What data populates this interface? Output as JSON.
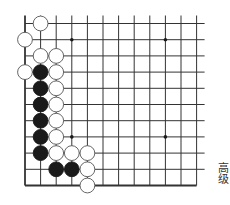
{
  "puzzle": {
    "level_label": "高级",
    "colors": {
      "background": "#ffffff",
      "grid_line": "#333333",
      "black_stone": "#1a1a1a",
      "white_stone_fill": "#ffffff",
      "white_stone_stroke": "#555555",
      "star_point": "#1a1a1a"
    },
    "grid": {
      "origin_x": 25,
      "origin_y": 23.5,
      "spacing_x": 15.6,
      "spacing_y": 16.2,
      "columns": 12,
      "rows": 11,
      "edges": {
        "left": "closed",
        "bottom": "closed",
        "top": "open",
        "right": "open"
      }
    },
    "star_points": [
      {
        "col": 3,
        "row": 1
      },
      {
        "col": 9,
        "row": 1
      },
      {
        "col": 3,
        "row": 7
      },
      {
        "col": 9,
        "row": 7
      }
    ],
    "stones": [
      {
        "color": "white",
        "col": 1,
        "row": 0
      },
      {
        "color": "white",
        "col": 0,
        "row": 1
      },
      {
        "color": "white",
        "col": 1,
        "row": 2
      },
      {
        "color": "white",
        "col": 2,
        "row": 2
      },
      {
        "color": "white",
        "col": 0,
        "row": 3
      },
      {
        "color": "black",
        "col": 1,
        "row": 3
      },
      {
        "color": "white",
        "col": 2,
        "row": 3
      },
      {
        "color": "black",
        "col": 1,
        "row": 4
      },
      {
        "color": "white",
        "col": 2,
        "row": 4
      },
      {
        "color": "black",
        "col": 1,
        "row": 5
      },
      {
        "color": "white",
        "col": 2,
        "row": 5
      },
      {
        "color": "black",
        "col": 1,
        "row": 6
      },
      {
        "color": "white",
        "col": 2,
        "row": 6
      },
      {
        "color": "black",
        "col": 1,
        "row": 7
      },
      {
        "color": "white",
        "col": 2,
        "row": 7
      },
      {
        "color": "black",
        "col": 1,
        "row": 8
      },
      {
        "color": "white",
        "col": 2,
        "row": 8
      },
      {
        "color": "white",
        "col": 3,
        "row": 8
      },
      {
        "color": "white",
        "col": 4,
        "row": 8
      },
      {
        "color": "black",
        "col": 2,
        "row": 9
      },
      {
        "color": "black",
        "col": 3,
        "row": 9
      },
      {
        "color": "white",
        "col": 4,
        "row": 9
      },
      {
        "color": "white",
        "col": 4,
        "row": 10
      }
    ]
  }
}
